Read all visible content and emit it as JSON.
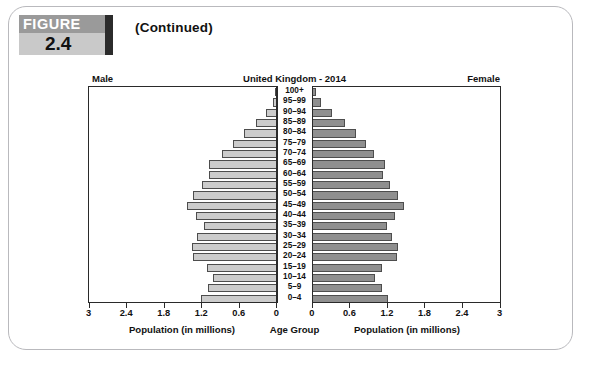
{
  "figure": {
    "word": "FIGURE",
    "number": "2.4",
    "continued": "(Continued)"
  },
  "chart_header": {
    "left_sex": "Male",
    "right_sex": "Female",
    "title": "United Kingdom - 2014"
  },
  "axis_captions": {
    "left": "Population (in millions)",
    "center": "Age Group",
    "right": "Population (in millions)"
  },
  "colors": {
    "male_bar": "#cccccc",
    "female_bar": "#8f8f8f",
    "bar_outline": "#4d4d4d",
    "axis": "#2a2a2a",
    "card_border": "#b9b9bd",
    "badge_top": "#9a9a9a",
    "badge_bottom": "#c9c9c9",
    "badge_accent": "#2b2b2b"
  },
  "chart_data": {
    "type": "bar",
    "subtype": "population-pyramid",
    "title": "United Kingdom - 2014",
    "xlabel": "Population (in millions)",
    "ylabel": "Age Group",
    "grid": false,
    "legend_position": "none",
    "xlim_left": [
      3,
      0
    ],
    "xlim_right": [
      0,
      3
    ],
    "left_ticks": [
      "3",
      "2.4",
      "1.8",
      "1.2",
      "0.6",
      "0"
    ],
    "left_tick_values": [
      3,
      2.4,
      1.8,
      1.2,
      0.6,
      0
    ],
    "right_ticks": [
      "0",
      "0.6",
      "1.2",
      "1.8",
      "2.4",
      "3"
    ],
    "right_tick_values": [
      0,
      0.6,
      1.2,
      1.8,
      2.4,
      3
    ],
    "categories": [
      "100+",
      "95–99",
      "90–94",
      "85–89",
      "80–84",
      "75–79",
      "70–74",
      "65–69",
      "60–64",
      "55–59",
      "50–54",
      "45–49",
      "40–44",
      "35–39",
      "30–34",
      "25–29",
      "20–24",
      "15–19",
      "10–14",
      "5–9",
      "0–4"
    ],
    "series": [
      {
        "name": "Male",
        "side": "left",
        "color": "#cccccc",
        "values": [
          0.02,
          0.06,
          0.17,
          0.34,
          0.52,
          0.7,
          0.88,
          1.09,
          1.09,
          1.2,
          1.34,
          1.44,
          1.29,
          1.17,
          1.27,
          1.35,
          1.34,
          1.11,
          1.02,
          1.1,
          1.22
        ]
      },
      {
        "name": "Female",
        "side": "right",
        "color": "#8f8f8f",
        "values": [
          0.07,
          0.15,
          0.32,
          0.52,
          0.71,
          0.86,
          0.99,
          1.16,
          1.14,
          1.24,
          1.37,
          1.47,
          1.32,
          1.19,
          1.28,
          1.38,
          1.35,
          1.12,
          1.0,
          1.12,
          1.22
        ]
      }
    ],
    "max_value": 3
  }
}
